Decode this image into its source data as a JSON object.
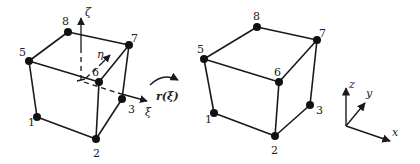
{
  "diagram": {
    "colors": {
      "stroke": "#1a1a1a",
      "node": "#111111",
      "text": "#222222"
    },
    "reference_element": {
      "nodes": [
        {
          "id": "1",
          "x": 37,
          "y": 117,
          "lx": 28,
          "ly": 126
        },
        {
          "id": "2",
          "x": 96,
          "y": 139,
          "lx": 93,
          "ly": 157
        },
        {
          "id": "3",
          "x": 122,
          "y": 99,
          "lx": 128,
          "ly": 113
        },
        {
          "id": "5",
          "x": 29,
          "y": 61,
          "lx": 19,
          "ly": 56
        },
        {
          "id": "6",
          "x": 99,
          "y": 82,
          "lx": 92,
          "ly": 76
        },
        {
          "id": "7",
          "x": 129,
          "y": 45,
          "lx": 131,
          "ly": 42
        },
        {
          "id": "8",
          "x": 68,
          "y": 32,
          "lx": 62,
          "ly": 25
        }
      ],
      "edges": [
        [
          "1",
          "2"
        ],
        [
          "2",
          "3"
        ],
        [
          "3",
          "7"
        ],
        [
          "1",
          "5"
        ],
        [
          "2",
          "6"
        ],
        [
          "5",
          "6"
        ],
        [
          "6",
          "7"
        ],
        [
          "7",
          "8"
        ],
        [
          "8",
          "5"
        ]
      ],
      "axes": {
        "xi_label": "ξ",
        "eta_label": "η",
        "zeta_label": "ζ"
      }
    },
    "mapping_label": "r(ξ)",
    "physical_element": {
      "nodes": [
        {
          "id": "1",
          "x": 214,
          "y": 113,
          "lx": 205,
          "ly": 123
        },
        {
          "id": "2",
          "x": 275,
          "y": 136,
          "lx": 271,
          "ly": 154
        },
        {
          "id": "3",
          "x": 310,
          "y": 105,
          "lx": 316,
          "ly": 114
        },
        {
          "id": "5",
          "x": 204,
          "y": 59,
          "lx": 197,
          "ly": 53
        },
        {
          "id": "6",
          "x": 279,
          "y": 82,
          "lx": 274,
          "ly": 76
        },
        {
          "id": "7",
          "x": 317,
          "y": 40,
          "lx": 319,
          "ly": 37
        },
        {
          "id": "8",
          "x": 257,
          "y": 27,
          "lx": 253,
          "ly": 20
        }
      ],
      "edges": [
        [
          "1",
          "2"
        ],
        [
          "2",
          "3"
        ],
        [
          "3",
          "7"
        ],
        [
          "1",
          "5"
        ],
        [
          "2",
          "6"
        ],
        [
          "5",
          "6"
        ],
        [
          "6",
          "7"
        ],
        [
          "7",
          "8"
        ],
        [
          "8",
          "5"
        ]
      ]
    },
    "global_axes": {
      "x_label": "x",
      "y_label": "y",
      "z_label": "z"
    }
  }
}
